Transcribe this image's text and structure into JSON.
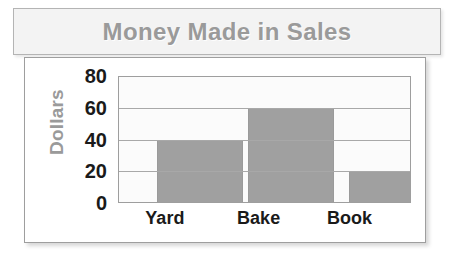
{
  "title": {
    "text": "Money Made in Sales",
    "color": "#9a9a9a"
  },
  "chart_data": {
    "type": "bar",
    "title": "Money Made in Sales",
    "xlabel": "",
    "ylabel": "Dollars",
    "categories": [
      "Yard",
      "Bake",
      "Book"
    ],
    "values": [
      40,
      60,
      20
    ],
    "series": [
      {
        "name": "Dollars",
        "values": [
          40,
          60,
          20
        ]
      }
    ],
    "ylim": [
      0,
      80
    ],
    "yticks": [
      0,
      20,
      40,
      60,
      80
    ],
    "ytick_labels": [
      "0",
      "20",
      "40",
      "60",
      "80"
    ],
    "grid": true,
    "gridlines_at": [
      20,
      40,
      60
    ],
    "legend": false,
    "legend_position": "none",
    "bar_color": "#a0a0a0",
    "plot_background": "#fbfbfb",
    "axis_color": "#9e9e9e",
    "tick_label_color": "#1a1a1a",
    "axis_title_color": "#9a9a9a"
  },
  "axis": {
    "y_title": "Dollars",
    "y_ticks": [
      "80",
      "60",
      "40",
      "20",
      "0"
    ],
    "x_ticks": [
      "Yard",
      "Bake",
      "Book"
    ]
  }
}
